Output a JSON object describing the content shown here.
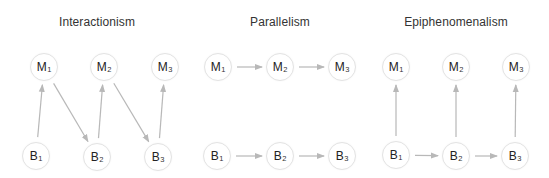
{
  "colors": {
    "background": "#ffffff",
    "arrow": "#b8b8b8",
    "node_border": "#e3e3e3",
    "text": "#222222"
  },
  "panels": [
    {
      "id": "interactionism",
      "title": "Interactionism",
      "title_x": 97,
      "nodes": [
        {
          "id": "M1",
          "letter": "M",
          "sub": "1",
          "x": 44,
          "y": 67
        },
        {
          "id": "M2",
          "letter": "M",
          "sub": "2",
          "x": 104,
          "y": 67
        },
        {
          "id": "M3",
          "letter": "M",
          "sub": "3",
          "x": 165,
          "y": 67
        },
        {
          "id": "B1",
          "letter": "B",
          "sub": "1",
          "x": 36,
          "y": 156
        },
        {
          "id": "B2",
          "letter": "B",
          "sub": "2",
          "x": 97,
          "y": 157
        },
        {
          "id": "B3",
          "letter": "B",
          "sub": "3",
          "x": 158,
          "y": 157
        }
      ],
      "edges": [
        {
          "from": "B1",
          "to": "M1"
        },
        {
          "from": "M1",
          "to": "B2"
        },
        {
          "from": "B2",
          "to": "M2"
        },
        {
          "from": "M2",
          "to": "B3"
        },
        {
          "from": "B3",
          "to": "M3"
        }
      ]
    },
    {
      "id": "parallelism",
      "title": "Parallelism",
      "title_x": 280,
      "nodes": [
        {
          "id": "M1",
          "letter": "M",
          "sub": "1",
          "x": 218,
          "y": 67
        },
        {
          "id": "M2",
          "letter": "M",
          "sub": "2",
          "x": 280,
          "y": 67
        },
        {
          "id": "M3",
          "letter": "M",
          "sub": "3",
          "x": 342,
          "y": 67
        },
        {
          "id": "B1",
          "letter": "B",
          "sub": "1",
          "x": 217,
          "y": 156
        },
        {
          "id": "B2",
          "letter": "B",
          "sub": "2",
          "x": 280,
          "y": 156
        },
        {
          "id": "B3",
          "letter": "B",
          "sub": "3",
          "x": 342,
          "y": 156
        }
      ],
      "edges": [
        {
          "from": "M1",
          "to": "M2"
        },
        {
          "from": "M2",
          "to": "M3"
        },
        {
          "from": "B1",
          "to": "B2"
        },
        {
          "from": "B2",
          "to": "B3"
        }
      ]
    },
    {
      "id": "epiphenomenalism",
      "title": "Epiphenomenalism",
      "title_x": 456,
      "nodes": [
        {
          "id": "M1",
          "letter": "M",
          "sub": "1",
          "x": 396,
          "y": 67
        },
        {
          "id": "M2",
          "letter": "M",
          "sub": "2",
          "x": 456,
          "y": 67
        },
        {
          "id": "M3",
          "letter": "M",
          "sub": "3",
          "x": 516,
          "y": 67
        },
        {
          "id": "B1",
          "letter": "B",
          "sub": "1",
          "x": 396,
          "y": 155
        },
        {
          "id": "B2",
          "letter": "B",
          "sub": "2",
          "x": 456,
          "y": 156
        },
        {
          "id": "B3",
          "letter": "B",
          "sub": "3",
          "x": 515,
          "y": 156
        }
      ],
      "edges": [
        {
          "from": "B1",
          "to": "M1"
        },
        {
          "from": "B2",
          "to": "M2"
        },
        {
          "from": "B3",
          "to": "M3"
        },
        {
          "from": "B1",
          "to": "B2"
        },
        {
          "from": "B2",
          "to": "B3"
        }
      ]
    }
  ]
}
